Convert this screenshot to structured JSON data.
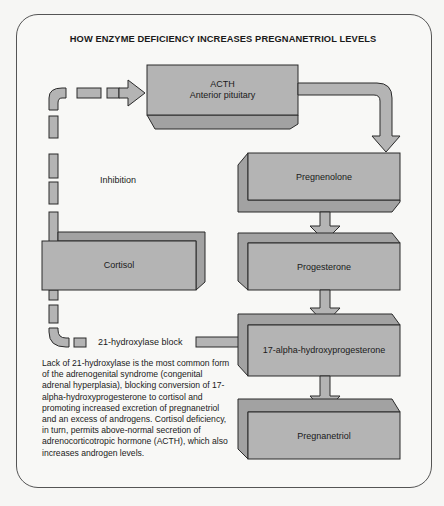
{
  "title": "HOW ENZYME DEFICIENCY INCREASES PREGNANETRIOL LEVELS",
  "colors": {
    "box_fill": "#b4b4b4",
    "box_side": "#a2a2a2",
    "outline": "#2a2a2a",
    "frame": "#555555",
    "background": "#f8f8f6"
  },
  "nodes": {
    "acth": {
      "line1": "ACTH",
      "line2": "Anterior pituitary"
    },
    "pregnenolone": {
      "label": "Pregnenolone"
    },
    "progesterone": {
      "label": "Progesterone"
    },
    "hydroxyprogesterone": {
      "label": "17-alpha-hydroxyprogesterone"
    },
    "pregnanetriol": {
      "label": "Pregnanetriol"
    },
    "cortisol": {
      "label": "Cortisol"
    }
  },
  "annotations": {
    "inhibition": "Inhibition",
    "block": "21-hydroxylase block"
  },
  "caption": "Lack of 21-hydroxylase is the most common form of the adrenogenital syndrome (congenital adrenal hyperplasia), blocking conversion of 17-alpha-hydroxyprogesterone to cortisol and promoting increased excretion of pregnanetriol and an excess of androgens. Cortisol deficiency, in turn, permits above-normal secretion of adrenocorticotropic hormone (ACTH), which also increases androgen levels.",
  "flow": [
    {
      "from": "ACTH",
      "to": "Pregnenolone",
      "style": "solid"
    },
    {
      "from": "Pregnenolone",
      "to": "Progesterone",
      "style": "solid"
    },
    {
      "from": "Progesterone",
      "to": "17-alpha-hydroxyprogesterone",
      "style": "solid"
    },
    {
      "from": "17-alpha-hydroxyprogesterone",
      "to": "Pregnanetriol",
      "style": "solid"
    },
    {
      "from": "17-alpha-hydroxyprogesterone",
      "to": "Cortisol",
      "style": "dashed",
      "note": "21-hydroxylase block"
    },
    {
      "from": "Cortisol",
      "to": "ACTH",
      "style": "dashed",
      "note": "Inhibition"
    }
  ]
}
